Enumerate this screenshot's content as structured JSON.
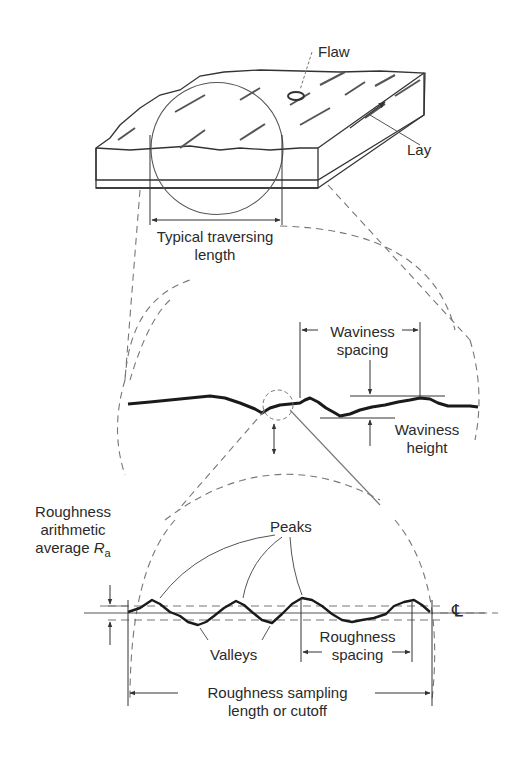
{
  "labels": {
    "flaw": "Flaw",
    "lay": "Lay",
    "traversing_1": "Typical traversing",
    "traversing_2": "length",
    "waviness_spacing_1": "Waviness",
    "waviness_spacing_2": "spacing",
    "waviness_height_1": "Waviness",
    "waviness_height_2": "height",
    "roughness_avg_1": "Roughness",
    "roughness_avg_2": "arithmetic",
    "roughness_avg_3": "average",
    "ra_symbol": "R",
    "ra_subscript": "a",
    "peaks": "Peaks",
    "valleys": "Valleys",
    "roughness_spacing_1": "Roughness",
    "roughness_spacing_2": "spacing",
    "centerline_symbol": "℄",
    "sampling_1": "Roughness sampling",
    "sampling_2": "length or cutoff"
  },
  "colors": {
    "line": "#333333",
    "profile": "#1a1a1a",
    "dashed": "#777777",
    "text": "#2a2a2a"
  }
}
